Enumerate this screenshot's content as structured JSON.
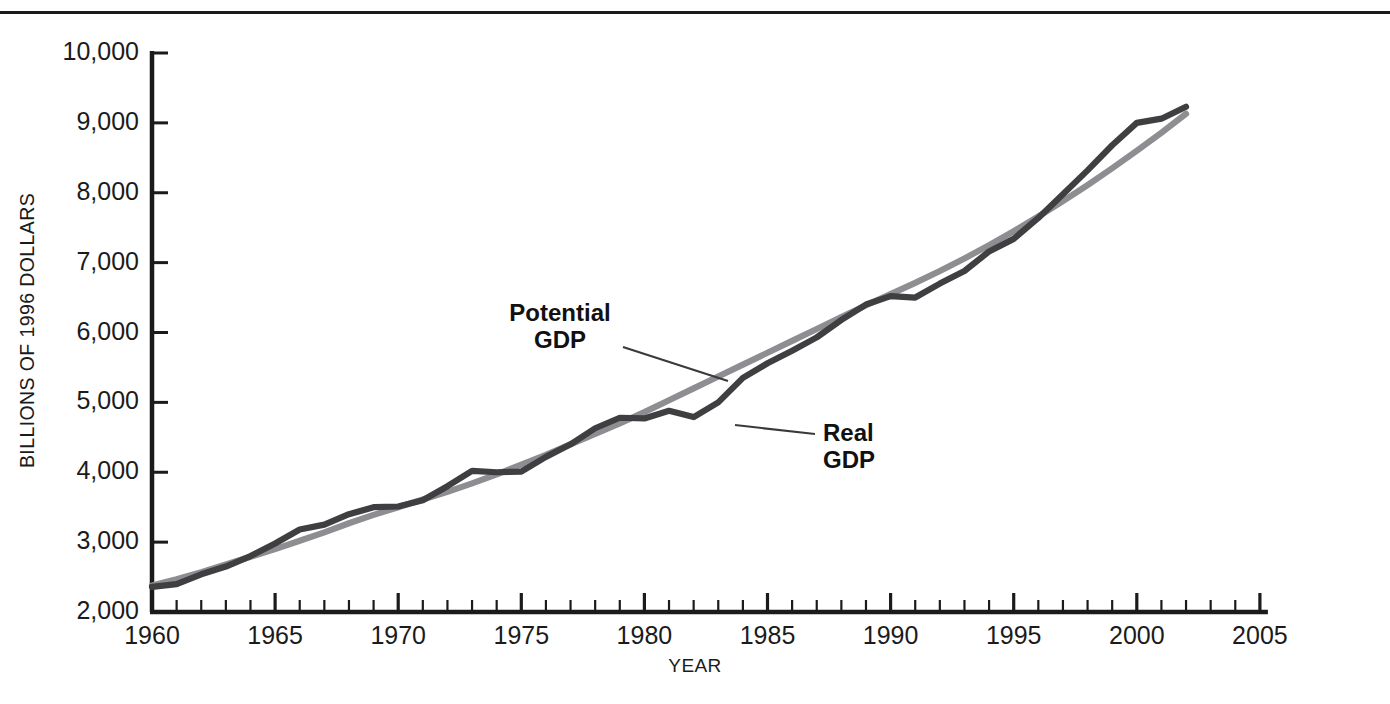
{
  "figure": {
    "top_rule": true,
    "background_color": "#ffffff"
  },
  "axes": {
    "y_axis_title": "BILLIONS OF 1996 DOLLARS",
    "y_tick_labels": [
      "10,000",
      "9,000",
      "8,000",
      "7,000",
      "6,000",
      "5,000",
      "4,000",
      "3,000",
      "2,000"
    ],
    "x_axis_title": "YEAR",
    "x_tick_labels": [
      "1960",
      "1965",
      "1970",
      "1975",
      "1980",
      "1985",
      "1990",
      "1995",
      "2000",
      "2005"
    ]
  },
  "annotations": {
    "potential": "Potential\nGDP",
    "real": "Real\nGDP"
  },
  "colors": {
    "real_gdp_line": "#3f3f42",
    "potential_gdp_line": "#8e8e92",
    "axis": "#1b1b1b",
    "text": "#1b1b1b",
    "leader_line": "#3a3a3a"
  },
  "chart_data": {
    "type": "line",
    "title": "",
    "xlabel": "YEAR",
    "ylabel": "BILLIONS OF 1996 DOLLARS",
    "xlim": [
      1960,
      2005
    ],
    "ylim": [
      2000,
      10000
    ],
    "x_major_ticks": [
      1960,
      1965,
      1970,
      1975,
      1980,
      1985,
      1990,
      1995,
      2000,
      2005
    ],
    "x_minor_tick_interval": 1,
    "y_ticks": [
      2000,
      3000,
      4000,
      5000,
      6000,
      7000,
      8000,
      9000,
      10000
    ],
    "grid": false,
    "legend_position": "inline-annotations",
    "x": [
      1960,
      1961,
      1962,
      1963,
      1964,
      1965,
      1966,
      1967,
      1968,
      1969,
      1970,
      1971,
      1972,
      1973,
      1974,
      1975,
      1976,
      1977,
      1978,
      1979,
      1980,
      1981,
      1982,
      1983,
      1984,
      1985,
      1986,
      1987,
      1988,
      1989,
      1990,
      1991,
      1992,
      1993,
      1994,
      1995,
      1996,
      1997,
      1998,
      1999,
      2000,
      2001,
      2002
    ],
    "series": [
      {
        "name": "Real GDP",
        "color": "#3f3f42",
        "values": [
          2360,
          2400,
          2540,
          2650,
          2800,
          2980,
          3180,
          3250,
          3400,
          3500,
          3510,
          3600,
          3800,
          4020,
          4000,
          4010,
          4220,
          4400,
          4630,
          4780,
          4770,
          4880,
          4790,
          5000,
          5350,
          5560,
          5740,
          5930,
          6180,
          6400,
          6520,
          6500,
          6700,
          6880,
          7160,
          7340,
          7640,
          7980,
          8320,
          8680,
          9000,
          9060,
          9230
        ]
      },
      {
        "name": "Potential GDP",
        "color": "#8e8e92",
        "values": [
          2380,
          2470,
          2570,
          2680,
          2790,
          2900,
          3020,
          3140,
          3270,
          3390,
          3500,
          3610,
          3720,
          3840,
          3970,
          4110,
          4250,
          4400,
          4550,
          4700,
          4860,
          5030,
          5200,
          5370,
          5540,
          5710,
          5880,
          6050,
          6220,
          6390,
          6550,
          6710,
          6880,
          7060,
          7250,
          7450,
          7660,
          7880,
          8110,
          8350,
          8600,
          8860,
          9130
        ]
      }
    ],
    "notes": [
      "Real GDP fluctuates around smooth Potential GDP trend",
      "Real GDP below potential in recessions: 1974-1975, 1980-1982, 1990-1991",
      "Real GDP above potential in expansions: 1966-1969, 1978-1979, 1997-2000"
    ]
  }
}
